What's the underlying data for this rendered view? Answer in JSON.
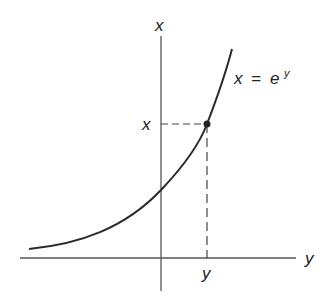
{
  "diagram": {
    "colors": {
      "axis": "#555555",
      "curve": "#2a2a2a",
      "dashed": "#444444",
      "text": "#222222",
      "background": "#ffffff"
    },
    "axes": {
      "vertical_label": "x",
      "horizontal_label": "y"
    },
    "curve": {
      "equation_lhs": "x",
      "equation_eq": "=",
      "equation_base": "e",
      "equation_exp": "y"
    },
    "marked_point": {
      "x_label": "x",
      "y_label": "y"
    }
  }
}
